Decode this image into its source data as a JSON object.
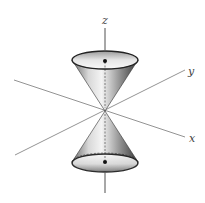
{
  "diagram": {
    "type": "double-cone-3d",
    "axes": {
      "z": {
        "label": "z"
      },
      "y": {
        "label": "y"
      },
      "x": {
        "label": "x"
      }
    },
    "colors": {
      "axis": "#666666",
      "outline": "#333333",
      "cone_light": "#f2f2f2",
      "cone_dark": "#5a5a5a",
      "dot": "#111111"
    }
  }
}
